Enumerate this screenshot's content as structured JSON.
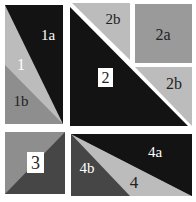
{
  "diagram": {
    "colors": {
      "black": "#131313",
      "light": "#bcbcbc",
      "medium": "#8e8e8e",
      "dark": "#464646",
      "square2a": "#9a9a9a",
      "background": "#ffffff"
    },
    "pieces": {
      "p1": "1",
      "p1a": "1a",
      "p1b": "1b",
      "p2": "2",
      "p2a": "2a",
      "p2b_top": "2b",
      "p2b_right": "2b",
      "p3": "3",
      "p4": "4",
      "p4a": "4a",
      "p4b": "4b"
    }
  }
}
